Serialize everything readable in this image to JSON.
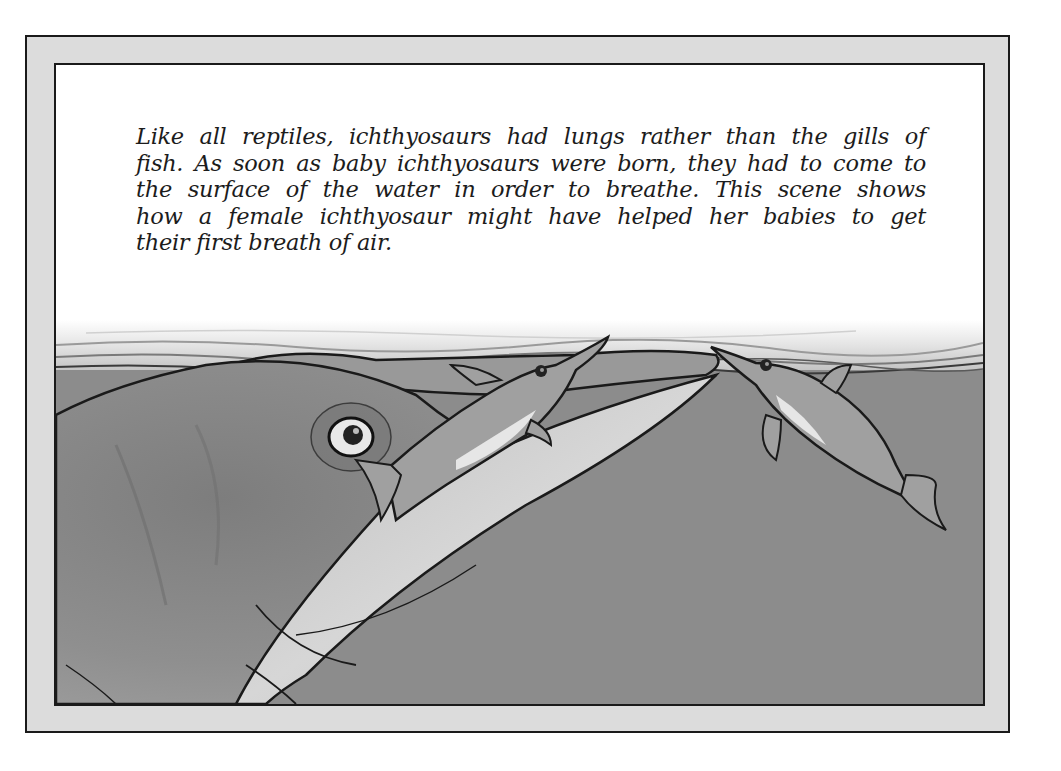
{
  "page": {
    "caption": {
      "lines": [
        "Like all reptiles, ichthyosaurs had lungs rather than the gills of",
        "fish. As soon as baby ichthyosaurs were born, they had to come to",
        "the surface of the water in order to breathe. This scene shows",
        "how a female ichthyosaur might have helped her babies to get",
        "their first breath of air."
      ]
    },
    "illustration": {
      "subject": "female ichthyosaur lifting baby ichthyosaurs to the water surface",
      "elements": [
        "water-surface",
        "mother-ichthyosaur-head",
        "baby-ichthyosaur-on-snout",
        "baby-ichthyosaur-swimming"
      ]
    },
    "colors": {
      "frame": "#dcdcdc",
      "border": "#1a1a1a",
      "panel": "#ffffff",
      "water": "#8c8c8c",
      "text": "#1c1c1c"
    }
  }
}
